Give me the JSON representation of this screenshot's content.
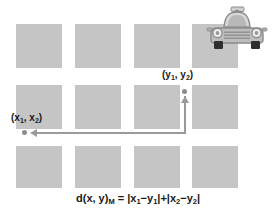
{
  "diagram": {
    "formula": {
      "lhs": "d(x, y)",
      "lhs_subscript": "M",
      "equals": "=",
      "term1": "|x",
      "term1_sub1": "1",
      "term1_mid": "−y",
      "term1_sub2": "1",
      "term1_end": "|",
      "plus": "+",
      "term2": "|x",
      "term2_sub1": "2",
      "term2_mid": "−y",
      "term2_sub2": "2",
      "term2_end": "|",
      "full_text": "d(x, y)M = |x1−y1|+|x2−y2|"
    },
    "points": [
      {
        "id": "point-x",
        "label_open": "(x",
        "label_sub1": "1",
        "label_mid": ", x",
        "label_sub2": "2",
        "label_close": ")",
        "full_label": "(x1, x2)"
      },
      {
        "id": "point-y",
        "label_open": "(y",
        "label_sub1": "1",
        "label_mid": ", y",
        "label_sub2": "2",
        "label_close": ")",
        "full_label": "(y1, y2)"
      }
    ],
    "grid": {
      "rows": 3,
      "columns": 4,
      "block_color": "#c5c5c5",
      "background_color": "#ffffff",
      "blocks": [
        {
          "row": 0,
          "col": 0,
          "x": 16,
          "y": 24,
          "w": 46,
          "h": 44
        },
        {
          "row": 0,
          "col": 1,
          "x": 75,
          "y": 24,
          "w": 46,
          "h": 44
        },
        {
          "row": 0,
          "col": 2,
          "x": 134,
          "y": 24,
          "w": 46,
          "h": 44
        },
        {
          "row": 0,
          "col": 3,
          "x": 192,
          "y": 24,
          "w": 46,
          "h": 44
        },
        {
          "row": 1,
          "col": 0,
          "x": 16,
          "y": 85,
          "w": 46,
          "h": 44
        },
        {
          "row": 1,
          "col": 1,
          "x": 75,
          "y": 85,
          "w": 46,
          "h": 44
        },
        {
          "row": 1,
          "col": 2,
          "x": 134,
          "y": 85,
          "w": 46,
          "h": 44
        },
        {
          "row": 1,
          "col": 3,
          "x": 192,
          "y": 85,
          "w": 46,
          "h": 44
        },
        {
          "row": 2,
          "col": 0,
          "x": 16,
          "y": 146,
          "w": 46,
          "h": 42
        },
        {
          "row": 2,
          "col": 1,
          "x": 75,
          "y": 146,
          "w": 46,
          "h": 42
        },
        {
          "row": 2,
          "col": 2,
          "x": 134,
          "y": 146,
          "w": 46,
          "h": 42
        },
        {
          "row": 2,
          "col": 3,
          "x": 192,
          "y": 146,
          "w": 46,
          "h": 42
        }
      ]
    },
    "path": {
      "stroke_color": "#9a9a9a",
      "dot_color": "#8c8c8c",
      "description": "L-shaped Manhattan route from (y1, y2) down then left to (x1, x2)",
      "arrow_directions": [
        "up",
        "left"
      ]
    },
    "taxi": {
      "name": "taxi-car-front-view",
      "body_color": "#b3b3b3",
      "outline_color": "#8a8a8a",
      "roof_sign_color": "#cccccc",
      "tire_color": "#2e2e2e"
    }
  }
}
